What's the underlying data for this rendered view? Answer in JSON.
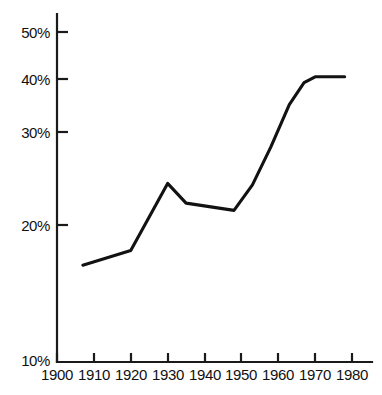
{
  "chart_data": {
    "type": "line",
    "title": "",
    "subtitle": "",
    "xlabel": "",
    "ylabel": "",
    "xlim": [
      1900,
      1980
    ],
    "ylim": [
      10,
      52
    ],
    "grid": false,
    "legend": null,
    "xticks": [
      "1900",
      "1910",
      "1920",
      "1930",
      "1940",
      "1950",
      "1960",
      "1970",
      "1980"
    ],
    "xtick_values": [
      1900,
      1910,
      1920,
      1930,
      1940,
      1950,
      1960,
      1970,
      1980
    ],
    "yticks": [
      "10%",
      "20%",
      "30%",
      "40%",
      "50%"
    ],
    "ytick_values": [
      10,
      20,
      30,
      40,
      50
    ],
    "axis_note": "y-axis is broken below 20%; the 10% label sits at the origin corner",
    "series": [
      {
        "name": "value",
        "x": [
          1907,
          1920,
          1930,
          1935,
          1948,
          1953,
          1958,
          1963,
          1967,
          1970,
          1978
        ],
        "values": [
          14.5,
          16.5,
          25.7,
          23.0,
          22.0,
          25.5,
          30.7,
          36.5,
          39.5,
          40.3,
          40.3
        ]
      }
    ],
    "line_color": "#121212",
    "axis_color": "#1a1a1a",
    "background_color": "#ffffff"
  }
}
